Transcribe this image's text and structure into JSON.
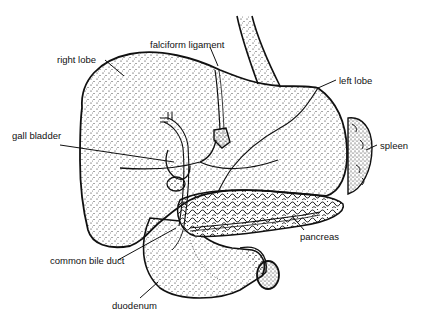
{
  "diagram": {
    "type": "anatomical-illustration",
    "ink_color": "#111111",
    "background_color": "#ffffff",
    "labels": [
      {
        "id": "right-lobe",
        "text": "right lobe",
        "x": 57,
        "y": 55
      },
      {
        "id": "falciform-ligament",
        "text": "falciform ligament",
        "x": 150,
        "y": 41
      },
      {
        "id": "left-lobe",
        "text": "left lobe",
        "x": 339,
        "y": 77
      },
      {
        "id": "gall-bladder",
        "text": "gall bladder",
        "x": 12,
        "y": 132
      },
      {
        "id": "spleen",
        "text": "spleen",
        "x": 380,
        "y": 142
      },
      {
        "id": "pancreas",
        "text": "pancreas",
        "x": 300,
        "y": 233
      },
      {
        "id": "common-bile-duct",
        "text": "common bile duct",
        "x": 50,
        "y": 257
      },
      {
        "id": "duodenum",
        "text": "duodenum",
        "x": 112,
        "y": 302
      }
    ]
  }
}
